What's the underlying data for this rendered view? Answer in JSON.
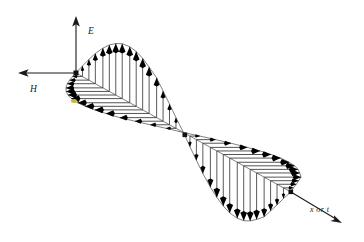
{
  "figure": {
    "background_color": "#ffffff",
    "ink_color": "#1a1a1a",
    "e_vector_color": "#5a5a5a",
    "h_vector_color": "#2a2a2a",
    "marker_color": "#c9b83a"
  },
  "axes": {
    "vertical": {
      "label": "E",
      "icon": "up-arrow-icon",
      "direction": "up",
      "label_x": 88,
      "label_y": 34
    },
    "horizontal": {
      "label": "H",
      "icon": "left-arrow-icon",
      "direction": "left",
      "label_x": 30,
      "label_y": 92
    },
    "propagation": {
      "label": "x or t",
      "icon": "down-right-arrow-icon",
      "direction": "down-right",
      "label_x": 310,
      "label_y": 212
    }
  },
  "origin": {
    "x": 76,
    "y": 73
  },
  "chart_data": {
    "type": "line",
    "xlabel": "x or t",
    "ylabel": "E",
    "zlabel": "H",
    "legend": [
      "E (electric field)",
      "H (magnetic field)"
    ],
    "lobes": [
      {
        "name": "first-half-cycle",
        "e_direction": "up",
        "h_direction": "left",
        "e_peak": 56,
        "h_peak": 52,
        "vector_count": 17
      },
      {
        "name": "second-half-cycle",
        "e_direction": "down",
        "h_direction": "right",
        "e_peak": -56,
        "h_peak": 52,
        "vector_count": 17
      }
    ],
    "phase_samples": [
      0.0,
      0.06,
      0.12,
      0.18,
      0.25,
      0.31,
      0.37,
      0.43,
      0.5,
      0.56,
      0.62,
      0.68,
      0.75,
      0.81,
      0.87,
      0.93,
      1.0,
      1.06,
      1.12,
      1.18,
      1.25,
      1.31,
      1.37,
      1.43,
      1.5,
      1.56,
      1.62,
      1.68,
      1.75,
      1.81,
      1.87,
      1.93,
      2.0
    ],
    "amplitude": [
      0.0,
      0.19,
      0.37,
      0.54,
      0.71,
      0.83,
      0.92,
      0.98,
      1.0,
      0.98,
      0.92,
      0.83,
      0.71,
      0.54,
      0.37,
      0.19,
      0.0,
      -0.19,
      -0.37,
      -0.54,
      -0.71,
      -0.83,
      -0.92,
      -0.98,
      -1.0,
      -0.98,
      -0.92,
      -0.83,
      -0.71,
      -0.54,
      -0.37,
      -0.19,
      0.0
    ],
    "grid": false,
    "legend_position": "none"
  }
}
